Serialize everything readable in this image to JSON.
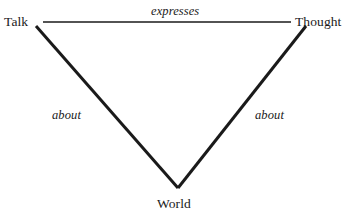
{
  "diagram": {
    "type": "triangle-relation-diagram",
    "background_color": "#ffffff",
    "line_color": "#1a1a1a",
    "text_color": "#1a1a1a",
    "nodes": [
      {
        "id": "talk",
        "label": "Talk",
        "position": "top-left"
      },
      {
        "id": "thought",
        "label": "Thought",
        "position": "top-right"
      },
      {
        "id": "world",
        "label": "World",
        "position": "bottom-center"
      }
    ],
    "edges": [
      {
        "id": "talk-thought",
        "label": "expresses",
        "from": "talk",
        "to": "thought",
        "style": "thin-horizontal",
        "stroke_width": 1.6,
        "x1": 43,
        "y1": 22,
        "x2": 291,
        "y2": 22
      },
      {
        "id": "talk-world",
        "label": "about",
        "from": "talk",
        "to": "world",
        "style": "thick-diagonal",
        "stroke_width": 3.0,
        "x1": 36,
        "y1": 26,
        "x2": 178,
        "y2": 188
      },
      {
        "id": "thought-world",
        "label": "about",
        "from": "thought",
        "to": "world",
        "style": "thick-diagonal",
        "stroke_width": 3.0,
        "x1": 178,
        "y1": 188,
        "x2": 306,
        "y2": 26
      }
    ]
  }
}
